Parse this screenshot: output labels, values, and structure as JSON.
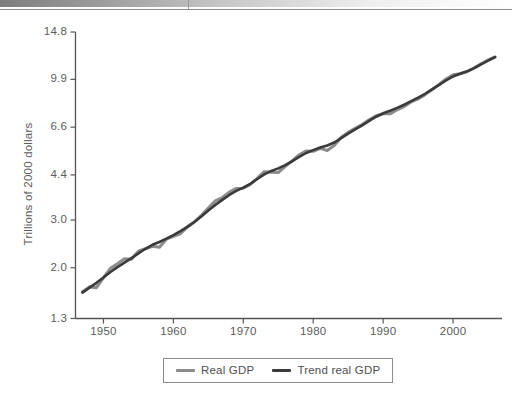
{
  "header": {
    "gradient_bar": "decorative-gradient-bar",
    "rule": "horizontal-rule"
  },
  "chart_data": {
    "type": "line",
    "title": "",
    "xlabel": "",
    "ylabel": "Trillions of 2000 dollars",
    "yscale": "log",
    "xlim": [
      1946,
      2007
    ],
    "ylim": [
      1.3,
      14.8
    ],
    "grid": false,
    "legend_position": "bottom-center",
    "ytick_labels": [
      "14.8",
      "9.9",
      "6.6",
      "4.4",
      "3.0",
      "2.0",
      "1.3"
    ],
    "ytick_values": [
      14.8,
      9.9,
      6.6,
      4.4,
      3.0,
      2.0,
      1.3
    ],
    "xtick_labels": [
      "1950",
      "1960",
      "1970",
      "1980",
      "1990",
      "2000"
    ],
    "xtick_values": [
      1950,
      1960,
      1970,
      1980,
      1990,
      2000
    ],
    "colors": {
      "real_gdp": "#8c8c8c",
      "trend_real_gdp": "#3a3a3a",
      "axis": "#555555",
      "text": "#5b5b5b"
    },
    "series": [
      {
        "name": "Real GDP",
        "color": "#8c8c8c",
        "x": [
          1947,
          1948,
          1949,
          1950,
          1951,
          1952,
          1953,
          1954,
          1955,
          1956,
          1957,
          1958,
          1959,
          1960,
          1961,
          1962,
          1963,
          1964,
          1965,
          1966,
          1967,
          1968,
          1969,
          1970,
          1971,
          1972,
          1973,
          1974,
          1975,
          1976,
          1977,
          1978,
          1979,
          1980,
          1981,
          1982,
          1983,
          1984,
          1985,
          1986,
          1987,
          1988,
          1989,
          1990,
          1991,
          1992,
          1993,
          1994,
          1995,
          1996,
          1997,
          1998,
          1999,
          2000,
          2001,
          2002,
          2003,
          2004,
          2005,
          2006
        ],
        "values": [
          1.63,
          1.7,
          1.69,
          1.84,
          1.99,
          2.07,
          2.16,
          2.15,
          2.3,
          2.35,
          2.4,
          2.38,
          2.55,
          2.61,
          2.67,
          2.83,
          2.95,
          3.12,
          3.32,
          3.53,
          3.63,
          3.8,
          3.92,
          3.93,
          4.06,
          4.27,
          4.52,
          4.5,
          4.49,
          4.73,
          4.95,
          5.22,
          5.39,
          5.38,
          5.51,
          5.41,
          5.65,
          6.06,
          6.31,
          6.53,
          6.74,
          7.02,
          7.27,
          7.4,
          7.39,
          7.65,
          7.86,
          8.18,
          8.39,
          8.7,
          9.09,
          9.48,
          9.93,
          10.29,
          10.39,
          10.57,
          10.89,
          11.29,
          11.65,
          11.97
        ]
      },
      {
        "name": "Trend real GDP",
        "color": "#3a3a3a",
        "x": [
          1947,
          1948,
          1949,
          1950,
          1951,
          1952,
          1953,
          1954,
          1955,
          1956,
          1957,
          1958,
          1959,
          1960,
          1961,
          1962,
          1963,
          1964,
          1965,
          1966,
          1967,
          1968,
          1969,
          1970,
          1971,
          1972,
          1973,
          1974,
          1975,
          1976,
          1977,
          1978,
          1979,
          1980,
          1981,
          1982,
          1983,
          1984,
          1985,
          1986,
          1987,
          1988,
          1989,
          1990,
          1991,
          1992,
          1993,
          1994,
          1995,
          1996,
          1997,
          1998,
          1999,
          2000,
          2001,
          2002,
          2003,
          2004,
          2005,
          2006
        ],
        "values": [
          1.62,
          1.69,
          1.76,
          1.84,
          1.93,
          2.01,
          2.09,
          2.17,
          2.26,
          2.35,
          2.43,
          2.49,
          2.56,
          2.64,
          2.73,
          2.83,
          2.95,
          3.09,
          3.25,
          3.41,
          3.56,
          3.71,
          3.84,
          3.95,
          4.08,
          4.25,
          4.42,
          4.55,
          4.65,
          4.78,
          4.95,
          5.13,
          5.3,
          5.43,
          5.55,
          5.65,
          5.79,
          6.01,
          6.25,
          6.47,
          6.7,
          6.96,
          7.21,
          7.42,
          7.58,
          7.77,
          7.98,
          8.23,
          8.48,
          8.76,
          9.09,
          9.45,
          9.82,
          10.15,
          10.38,
          10.6,
          10.89,
          11.25,
          11.61,
          11.95
        ]
      }
    ]
  },
  "legend": {
    "items": [
      {
        "label": "Real GDP",
        "color": "#8c8c8c"
      },
      {
        "label": "Trend real GDP",
        "color": "#3a3a3a"
      }
    ]
  }
}
